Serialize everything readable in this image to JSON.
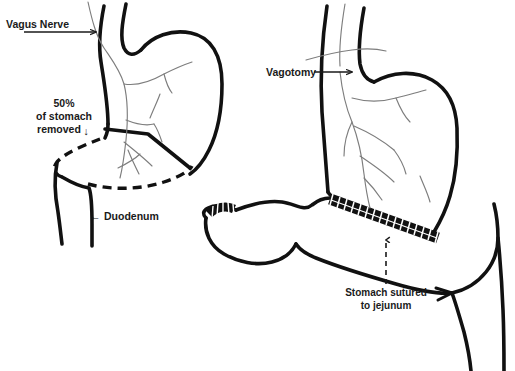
{
  "figure": {
    "background_color": "#ffffff",
    "ink_color": "#111111",
    "nerve_color": "#7d7d7d",
    "width": 515,
    "height": 371
  },
  "panels": {
    "left": {
      "name": "Pre-resection stomach with intact vagus nerve",
      "labels": {
        "vagus_nerve": "Vagus Nerve",
        "removed_line1": "50%",
        "removed_line2": "of stomach",
        "removed_line3": "removed",
        "removed_arrow_glyph": "↓",
        "duodenum_arrow_glyph": "←",
        "duodenum": "Duodenum"
      }
    },
    "right": {
      "name": "Post-operative stomach sutured to jejunum with severed vagus nerve",
      "labels": {
        "vagotomy": "Vagotomy",
        "sutured_line1": "Stomach sutured",
        "sutured_line2": "to jejunum"
      }
    }
  },
  "annotations": {
    "vagus_nerve_arrow": "arrow-right",
    "vagotomy_arrow": "arrow-right",
    "removed_arrow": "arrow-down",
    "duodenum_arrow": "arrow-left",
    "sutured_arrow": "dashed-arrow-up"
  }
}
